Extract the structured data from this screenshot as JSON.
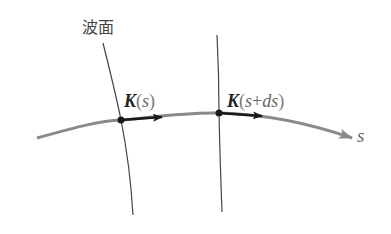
{
  "diagram": {
    "wavefront_label": "波面",
    "vector_labels": [
      {
        "symbol": "K",
        "open": "(",
        "arg": "s",
        "close": ")"
      },
      {
        "symbol": "K",
        "open": "(",
        "arg_start": "s",
        "plus": "+",
        "arg_end": "ds",
        "close": ")"
      }
    ],
    "curve_label": "s",
    "colors": {
      "ray_curve": "#8a8a8a",
      "wavefront_line": "#444444",
      "vector_arrow": "#1a1a1a",
      "point": "#1a1a1a"
    }
  }
}
